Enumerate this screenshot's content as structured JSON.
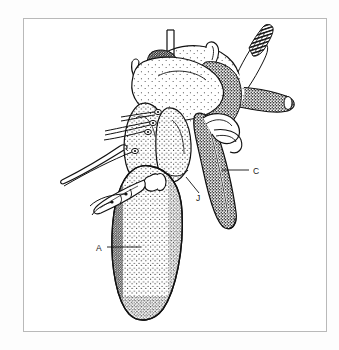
{
  "figure": {
    "kind": "anatomical-line-drawing",
    "style": "black and white stippled patent illustration",
    "background_color": "#ffffff",
    "ink_color": "#111111",
    "frame_color": "#b9b9b9"
  },
  "labels": [
    {
      "id": "a",
      "text": "A",
      "x": 98,
      "y": 250,
      "leader": {
        "x1": 107,
        "y1": 247,
        "x2": 141,
        "y2": 247
      }
    },
    {
      "id": "c",
      "text": "C",
      "x": 254,
      "y": 174,
      "leader": {
        "x1": 222,
        "y1": 170,
        "x2": 249,
        "y2": 170
      }
    },
    {
      "id": "j",
      "text": "J",
      "x": 197,
      "y": 200,
      "leader": {
        "x1": 186,
        "y1": 177,
        "x2": 200,
        "y2": 193
      }
    }
  ],
  "parts": [
    {
      "name": "ventricle-body",
      "label_ref": "A"
    },
    {
      "name": "cannula-tube",
      "label_ref": "C"
    },
    {
      "name": "atrial-junction",
      "label_ref": "J"
    },
    {
      "name": "aortic-arch",
      "label_ref": null
    },
    {
      "name": "cut-vessel-end",
      "label_ref": null
    },
    {
      "name": "suture-threads",
      "label_ref": null
    },
    {
      "name": "catheter-connector",
      "label_ref": null
    }
  ]
}
